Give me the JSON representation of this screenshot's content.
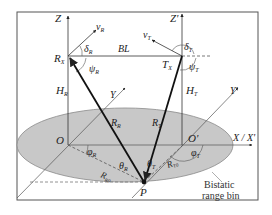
{
  "diagram": {
    "type": "bistatic-sar-geometry",
    "colors": {
      "frame": "#555555",
      "ellipse_fill": "#c8c8c8",
      "ellipse_stroke": "#8a8a8a",
      "line": "#222222",
      "thin_line": "#555555",
      "dashed": "#777777"
    },
    "labels": {
      "z_left": "Z",
      "z_right": "Z'",
      "v_r": "v",
      "v_r_sub": "R",
      "v_t": "v",
      "v_t_sub": "T",
      "delta_r": "δ",
      "delta_r_sub": "R",
      "delta_t": "δ",
      "delta_t_sub": "T",
      "bl": "BL",
      "rx": "R",
      "rx_sub": "X",
      "tx": "T",
      "tx_sub": "X",
      "psi_r": "ψ",
      "psi_r_sub": "R",
      "psi_t": "ψ",
      "psi_t_sub": "T",
      "h_r": "H",
      "h_r_sub": "R",
      "h_t": "H",
      "h_t_sub": "T",
      "y_left": "Y",
      "y_right": "Y'",
      "r_r": "R",
      "r_r_sub": "R",
      "r_t": "R",
      "r_t_sub": "T",
      "origin_left": "O",
      "origin_right": "O'",
      "x_axis": "X / X'",
      "phi_r": "φ",
      "phi_r_sub": "R",
      "phi_t": "φ",
      "phi_t_sub": "T",
      "r_r0": "R",
      "r_r0_sub": "R0",
      "r_t0": "R",
      "r_t0_sub": "T0",
      "theta_r": "θ",
      "theta_r_sub": "R",
      "theta_t": "θ",
      "theta_t_sub": "T",
      "p": "P",
      "bistatic_line1": "Bistatic",
      "bistatic_line2": "range bin"
    }
  }
}
